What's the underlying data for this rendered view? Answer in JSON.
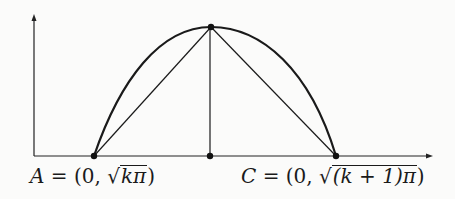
{
  "figure": {
    "type": "parabola-arc-triangle",
    "axes": {
      "x_arrow": true,
      "y_arrow": true
    },
    "points": [
      {
        "name": "A",
        "role": "left-root",
        "x": 94,
        "y": 156
      },
      {
        "name": "apex",
        "role": "maximum",
        "x": 211,
        "y": 27
      },
      {
        "name": "foot",
        "role": "perpendicular-foot",
        "x": 209,
        "y": 156
      },
      {
        "name": "C",
        "role": "right-root",
        "x": 336,
        "y": 156
      }
    ],
    "segments": [
      "A-apex",
      "apex-C",
      "apex-foot"
    ],
    "stroke_color": "#1a1a1a"
  },
  "labels": {
    "a": {
      "var": "A",
      "eq": " = (0, ",
      "radicand": "kπ",
      "close": ")"
    },
    "c": {
      "var": "C",
      "eq": " = (0, ",
      "radicand": "(k + 1)π",
      "close": ")"
    }
  }
}
